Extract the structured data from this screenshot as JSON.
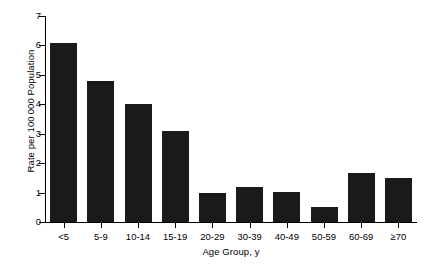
{
  "chart_data": {
    "type": "bar",
    "title": "",
    "xlabel": "Age Group, y",
    "ylabel": "Rate per 100 000 Population",
    "categories": [
      "<5",
      "5-9",
      "10-14",
      "15-19",
      "20-29",
      "30-39",
      "40-49",
      "50-59",
      "60-69",
      "≥70"
    ],
    "values": [
      6.1,
      4.8,
      4.0,
      3.1,
      1.0,
      1.2,
      1.02,
      0.5,
      1.67,
      1.48
    ],
    "ylim": [
      0,
      7
    ],
    "yticks": [
      0,
      1,
      2,
      3,
      4,
      5,
      6,
      7
    ],
    "ytick_labels": [
      "0",
      "1",
      "2",
      "3",
      "4",
      "5",
      "6",
      "7"
    ],
    "grid": false,
    "legend": null,
    "bar_color": "#1a1a1a",
    "axis_color": "#000000",
    "background": "#ffffff"
  }
}
